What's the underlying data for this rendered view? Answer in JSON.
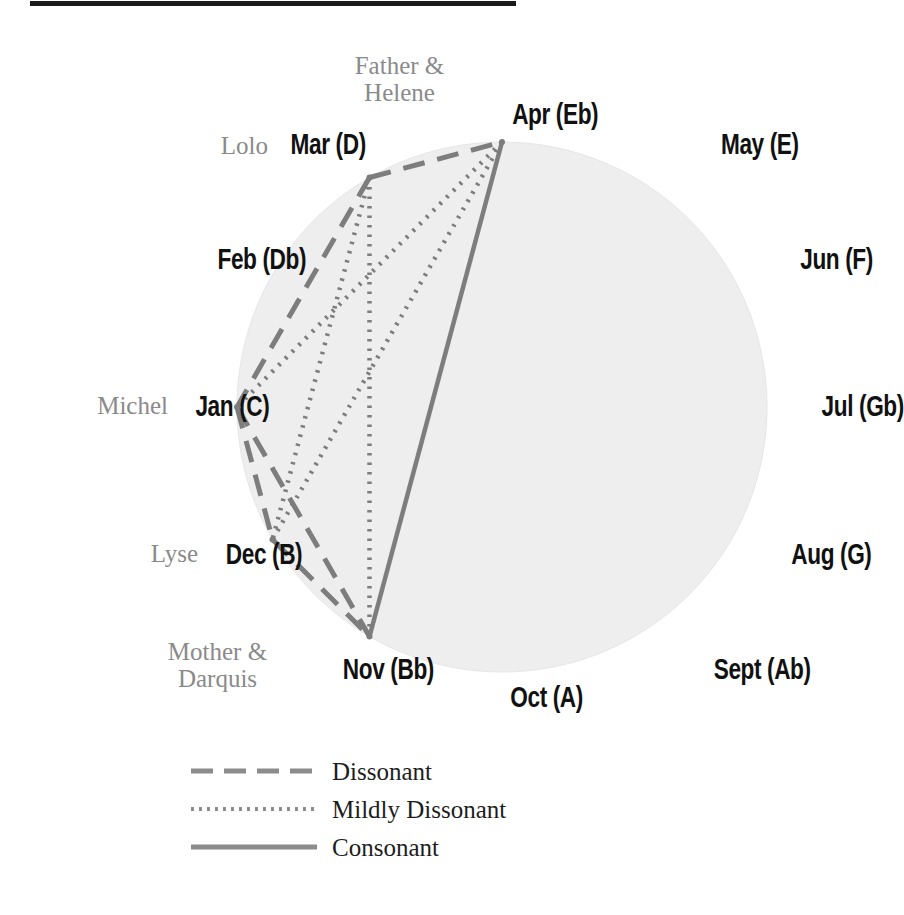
{
  "figure": {
    "type": "chromatic-circle-relationship-diagram",
    "rule_color": "#1b1b1b",
    "circle_fill": "#eeeeee",
    "line_color": "#7d7d7d"
  },
  "chart_data": {
    "type": "diagram",
    "title": "",
    "subtitle": "",
    "xlabel": "",
    "ylabel": "",
    "grid": false,
    "legend_position": "bottom-left",
    "circle": {
      "cx": 502,
      "cy": 407,
      "r": 265,
      "fill": "#eeeeee"
    },
    "node_order_clockwise_from_top": [
      "Apr (Eb)",
      "May (E)",
      "Jun (F)",
      "Jul (Gb)",
      "Aug (G)",
      "Sept (Ab)",
      "Oct (A)",
      "Nov (Bb)",
      "Dec (B)",
      "Jan (C)",
      "Feb (Db)",
      "Mar (D)"
    ],
    "nodes": [
      {
        "id": "apr",
        "label": "Apr (Eb)",
        "note": "Eb",
        "month": "Apr",
        "angle_deg": 0,
        "character": "Father &\nHelene",
        "plotted": true
      },
      {
        "id": "may",
        "label": "May (E)",
        "note": "E",
        "month": "May",
        "angle_deg": 30,
        "character": "",
        "plotted": false
      },
      {
        "id": "jun",
        "label": "Jun (F)",
        "note": "F",
        "month": "Jun",
        "angle_deg": 60,
        "character": "",
        "plotted": false
      },
      {
        "id": "jul",
        "label": "Jul (Gb)",
        "note": "Gb",
        "month": "Jul",
        "angle_deg": 90,
        "character": "",
        "plotted": false
      },
      {
        "id": "aug",
        "label": "Aug (G)",
        "note": "G",
        "month": "Aug",
        "angle_deg": 120,
        "character": "",
        "plotted": false
      },
      {
        "id": "sept",
        "label": "Sept (Ab)",
        "note": "Ab",
        "month": "Sept",
        "angle_deg": 150,
        "character": "",
        "plotted": false
      },
      {
        "id": "oct",
        "label": "Oct (A)",
        "note": "A",
        "month": "Oct",
        "angle_deg": 180,
        "character": "",
        "plotted": false
      },
      {
        "id": "nov",
        "label": "Nov (Bb)",
        "note": "Bb",
        "month": "Nov",
        "angle_deg": 210,
        "character": "Mother &\nDarquis",
        "plotted": true
      },
      {
        "id": "dec",
        "label": "Dec (B)",
        "note": "B",
        "month": "Dec",
        "angle_deg": 240,
        "character": "Lyse",
        "plotted": true
      },
      {
        "id": "jan",
        "label": "Jan (C)",
        "note": "C",
        "month": "Jan",
        "angle_deg": 270,
        "character": "Michel",
        "plotted": true
      },
      {
        "id": "feb",
        "label": "Feb (Db)",
        "note": "Db",
        "month": "Feb",
        "angle_deg": 300,
        "character": "",
        "plotted": false
      },
      {
        "id": "mar",
        "label": "Mar (D)",
        "note": "D",
        "month": "Mar",
        "angle_deg": 330,
        "character": "Lolo",
        "plotted": true
      }
    ],
    "edges": [
      {
        "from": "mar",
        "to": "apr",
        "relation": "Dissonant"
      },
      {
        "from": "mar",
        "to": "jan",
        "relation": "Dissonant"
      },
      {
        "from": "jan",
        "to": "dec",
        "relation": "Dissonant"
      },
      {
        "from": "jan",
        "to": "nov",
        "relation": "Dissonant"
      },
      {
        "from": "dec",
        "to": "nov",
        "relation": "Dissonant"
      },
      {
        "from": "mar",
        "to": "dec",
        "relation": "Mildly Dissonant"
      },
      {
        "from": "mar",
        "to": "nov",
        "relation": "Mildly Dissonant"
      },
      {
        "from": "apr",
        "to": "jan",
        "relation": "Mildly Dissonant"
      },
      {
        "from": "apr",
        "to": "dec",
        "relation": "Mildly Dissonant"
      },
      {
        "from": "apr",
        "to": "nov",
        "relation": "Consonant"
      }
    ]
  },
  "labels": {
    "apr": "Apr (Eb)",
    "may": "May (E)",
    "jun": "Jun (F)",
    "jul": "Jul (Gb)",
    "aug": "Aug (G)",
    "sept": "Sept (Ab)",
    "oct": "Oct (A)",
    "nov": "Nov (Bb)",
    "dec": "Dec (B)",
    "jan": "Jan (C)",
    "feb": "Feb (Db)",
    "mar": "Mar (D)"
  },
  "characters": {
    "father_helene": "Father &\nHelene",
    "lolo": "Lolo",
    "michel": "Michel",
    "lyse": "Lyse",
    "mother_darquis": "Mother &\nDarquis"
  },
  "legend": {
    "items": [
      {
        "label": "Dissonant",
        "style": "dashed"
      },
      {
        "label": "Mildly Dissonant",
        "style": "dotted"
      },
      {
        "label": "Consonant",
        "style": "solid"
      }
    ],
    "dissonant": "Dissonant",
    "mildly_dissonant": "Mildly Dissonant",
    "consonant": "Consonant"
  }
}
